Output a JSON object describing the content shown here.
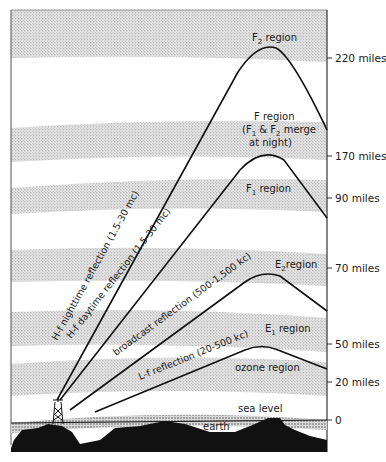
{
  "axis": {
    "ticks": [
      {
        "label": "220 miles",
        "y": 58
      },
      {
        "label": "170 miles",
        "y": 156
      },
      {
        "label": "90 miles",
        "y": 198
      },
      {
        "label": "70 miles",
        "y": 268
      },
      {
        "label": "50 miles",
        "y": 344
      },
      {
        "label": "20 miles",
        "y": 382
      },
      {
        "label": "0",
        "y": 420
      }
    ]
  },
  "regions": {
    "f2": {
      "main": "F",
      "sub": "2",
      "rest": " region"
    },
    "f_line1": "F region",
    "f_line2_open": "(F",
    "f_line2_sub1": "1",
    "f_line2_mid": " & F",
    "f_line2_sub2": "2",
    "f_line2_end": " merge",
    "f_line3": "at night)",
    "f1": {
      "main": "F",
      "sub": "1",
      "rest": " region"
    },
    "e2": {
      "main": "E",
      "sub": "2",
      "rest": "region"
    },
    "e1": {
      "main": "E",
      "sub": "1",
      "rest": " region"
    },
    "ozone": "ozone region",
    "sea_level": "sea level",
    "earth": "earth"
  },
  "paths": {
    "hf_night": "H-f nighttime reflection (1.5-30 mc)",
    "hf_day": "H-f daytime reflection (1.5-30 mc)",
    "broadcast": "broadcast reflection (500-1,500 kc)",
    "lf": "L-f reflection (20-500 kc)"
  },
  "colors": {
    "ink": "#111111",
    "stipple": "#b8b8b8",
    "background": "#ffffff"
  }
}
